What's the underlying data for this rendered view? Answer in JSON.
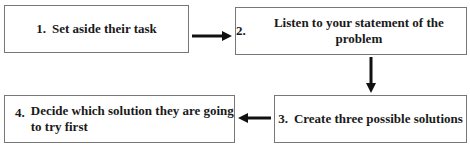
{
  "diagram": {
    "type": "flowchart",
    "steps": [
      {
        "number": "1.",
        "text": "Set aside their task"
      },
      {
        "number": "2.",
        "text": "Listen to your statement of the problem"
      },
      {
        "number": "3.",
        "text": "Create three possible solutions"
      },
      {
        "number": "4.",
        "text": "Decide which solution they are going to try first",
        "line1": "Decide which solution they are going",
        "line2": "to try first"
      }
    ],
    "connections": [
      {
        "from": 1,
        "to": 2,
        "direction": "right"
      },
      {
        "from": 2,
        "to": 3,
        "direction": "down"
      },
      {
        "from": 3,
        "to": 4,
        "direction": "left"
      }
    ],
    "colors": {
      "border": "#777777",
      "text": "#1a1a1a",
      "arrow": "#111111",
      "background": "#ffffff"
    }
  }
}
